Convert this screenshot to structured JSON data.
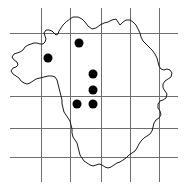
{
  "figure": {
    "kind": "distribution-map",
    "width": 184,
    "height": 191,
    "background_color": "#ffffff"
  },
  "chart_data": {
    "type": "scatter",
    "title": "",
    "subtitle": "",
    "xlabel": "",
    "ylabel": "",
    "grid": true,
    "legend": false,
    "xlim": [
      0,
      184
    ],
    "ylim": [
      0,
      191
    ],
    "series": [
      {
        "name": "occurrence-records",
        "marker": "filled-circle",
        "color": "#000000",
        "radius": 4.5,
        "points": [
          {
            "x": 48,
            "y": 58
          },
          {
            "x": 79,
            "y": 43
          },
          {
            "x": 93,
            "y": 74
          },
          {
            "x": 93,
            "y": 90
          },
          {
            "x": 93,
            "y": 104
          },
          {
            "x": 77,
            "y": 104
          }
        ]
      }
    ],
    "annotations": []
  },
  "grid": {
    "color": "#6e6e6e",
    "stroke_width": 1,
    "vertical_x": [
      41,
      70,
      101,
      130,
      159
    ],
    "vertical_y_start": [
      8,
      8,
      8,
      8,
      8
    ],
    "vertical_y_end": [
      182,
      182,
      182,
      182,
      182
    ],
    "horizontal_y": [
      33,
      96,
      128,
      157
    ],
    "horizontal_x_start": [
      10,
      10,
      10,
      10
    ],
    "horizontal_x_end": [
      178,
      178,
      178,
      178
    ]
  },
  "region": {
    "name": "region-boundary",
    "outline_color": "#1a1a1a",
    "fill": "none",
    "stroke_width": 1,
    "path": "M 70 19 L 73 17 L 78 17 L 82 19 L 85 22 L 88 26 L 92 29 L 96 28 L 100 25 L 104 23 L 108 22 L 112 20 L 116 19 L 118 22 L 120 25 L 123 22 L 126 20 L 130 20 L 133 22 L 136 25 L 138 29 L 140 33 L 141 37 L 143 41 L 146 44 L 149 47 L 152 50 L 155 54 L 157 58 L 158 62 L 159 66 L 161 69 L 164 70 L 167 69 L 170 70 L 172 73 L 171 77 L 168 79 L 165 81 L 163 84 L 163 88 L 165 91 L 167 94 L 166 98 L 163 100 L 160 101 L 158 104 L 158 108 L 160 111 L 161 115 L 159 118 L 156 120 L 154 123 L 153 127 L 152 131 L 150 134 L 147 136 L 144 138 L 141 141 L 139 144 L 137 148 L 135 151 L 132 153 L 129 155 L 126 158 L 123 160 L 120 162 L 117 163 L 114 165 L 111 167 L 108 168 L 105 167 L 102 165 L 99 164 L 96 165 L 93 166 L 90 165 L 87 163 L 84 161 L 82 158 L 80 155 L 79 151 L 78 147 L 77 143 L 75 140 L 73 137 L 72 133 L 72 129 L 71 125 L 70 121 L 68 118 L 66 115 L 64 112 L 63 108 L 62 104 L 62 100 L 61 96 L 60 92 L 59 88 L 58 84 L 57 80 L 55 77 L 52 76 L 48 76 L 44 77 L 40 78 L 36 79 L 33 81 L 30 83 L 27 84 L 24 83 L 21 81 L 19 78 L 16 76 L 13 74 L 11 71 L 13 68 L 16 67 L 18 65 L 17 62 L 14 60 L 12 57 L 14 54 L 17 53 L 20 52 L 23 50 L 25 47 L 28 45 L 31 44 L 34 43 L 37 43 L 40 44 L 43 44 L 45 42 L 46 39 L 45 36 L 44 33 L 46 30 L 49 30 L 52 31 L 54 33 L 56 35 L 58 34 L 59 31 L 61 28 L 63 25 L 66 22 Z"
  }
}
